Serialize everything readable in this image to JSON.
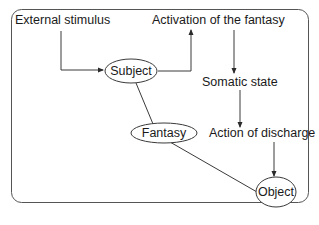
{
  "diagram": {
    "type": "flow",
    "nodes": {
      "external_stimulus": {
        "label": "External stimulus",
        "shape": "text"
      },
      "subject": {
        "label": "Subject",
        "shape": "ellipse"
      },
      "activation": {
        "label": "Activation of the fantasy",
        "shape": "text"
      },
      "somatic_state": {
        "label": "Somatic state",
        "shape": "text"
      },
      "action_of_discharge": {
        "label": "Action of discharge",
        "shape": "text"
      },
      "fantasy": {
        "label": "Fantasy",
        "shape": "ellipse"
      },
      "object": {
        "label": "Object",
        "shape": "ellipse"
      }
    },
    "edges": [
      {
        "from": "External stimulus",
        "to": "Subject",
        "arrow": true
      },
      {
        "from": "Subject",
        "to": "Activation of the fantasy",
        "arrow": true
      },
      {
        "from": "Activation of the fantasy",
        "to": "Somatic state",
        "arrow": true
      },
      {
        "from": "Somatic state",
        "to": "Action of discharge",
        "arrow": true
      },
      {
        "from": "Action of discharge",
        "to": "Object",
        "arrow": true
      },
      {
        "from": "Subject",
        "to": "Fantasy",
        "arrow": false
      },
      {
        "from": "Fantasy",
        "to": "Object",
        "arrow": false
      }
    ],
    "colors": {
      "line": "#3a3a3a",
      "frame": "#555555",
      "text": "#1a1a1a",
      "background": "#ffffff"
    }
  }
}
